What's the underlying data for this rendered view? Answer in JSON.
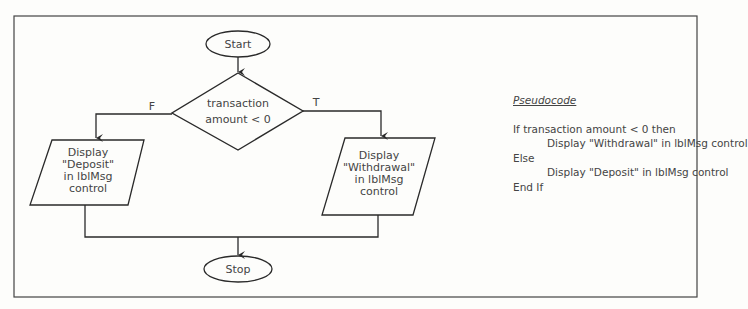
{
  "flowchart": {
    "start_label": "Start",
    "stop_label": "Stop",
    "decision": {
      "line1": "transaction",
      "line2": "amount < 0"
    },
    "false_label": "F",
    "true_label": "T",
    "false_branch": {
      "lines": [
        "Display",
        "\"Deposit\"",
        "in lblMsg",
        "control"
      ]
    },
    "true_branch": {
      "lines": [
        "Display",
        "\"Withdrawal\"",
        "in lblMsg",
        "control"
      ]
    }
  },
  "pseudocode": {
    "title": "Pseudocode",
    "lines": [
      {
        "text": "If transaction amount < 0 then",
        "indent": 0
      },
      {
        "text": "Display \"Withdrawal\" in lblMsg control",
        "indent": 1
      },
      {
        "text": "Else",
        "indent": 0
      },
      {
        "text": "Display \"Deposit\" in lblMsg control",
        "indent": 1
      },
      {
        "text": "End If",
        "indent": 0
      }
    ]
  },
  "colors": {
    "stroke": "#2a2a2a",
    "text": "#444444",
    "background": "#fdfdfb"
  }
}
